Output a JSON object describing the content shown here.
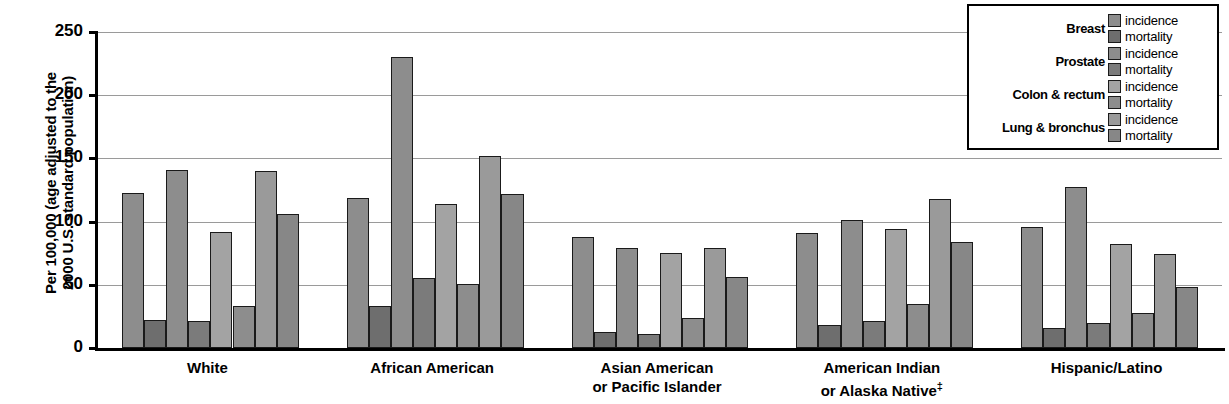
{
  "chart_data": {
    "type": "bar",
    "title": "",
    "xlabel": "",
    "ylabel": "Per 100,000 (age adjusted to the 2000 U.S. standard population)",
    "ylim": [
      0,
      250
    ],
    "yticks": [
      0,
      50,
      100,
      150,
      200,
      250
    ],
    "grid": true,
    "legend_position": "top-right",
    "categories": [
      "White",
      "African American",
      "Asian American or Pacific Islander",
      "American Indian or Alaska Native‡",
      "Hispanic/Latino"
    ],
    "series": [
      {
        "name": "Breast incidence",
        "key": "inc-breast",
        "color": "#8d8d8d",
        "values": [
          123,
          119,
          88,
          91,
          96
        ]
      },
      {
        "name": "Breast mortality",
        "key": "mor-breast",
        "color": "#6e6e6e",
        "values": [
          22,
          33,
          13,
          18,
          16
        ]
      },
      {
        "name": "Prostate incidence",
        "key": "inc-prostate",
        "color": "#8d8d8d",
        "values": [
          141,
          230,
          79,
          101,
          127
        ]
      },
      {
        "name": "Prostate mortality",
        "key": "mor-prostate",
        "color": "#7b7b7b",
        "values": [
          21,
          55,
          11,
          21,
          20
        ]
      },
      {
        "name": "Colon & rectum incidence",
        "key": "inc-colon",
        "color": "#a3a3a3",
        "values": [
          92,
          114,
          75,
          94,
          82
        ]
      },
      {
        "name": "Colon & rectum mortality",
        "key": "mor-colon",
        "color": "#8d8d8d",
        "values": [
          33,
          51,
          24,
          35,
          28
        ]
      },
      {
        "name": "Lung & bronchus incidence",
        "key": "inc-lung",
        "color": "#9a9a9a",
        "values": [
          140,
          152,
          79,
          118,
          74
        ]
      },
      {
        "name": "Lung & bronchus mortality",
        "key": "mor-lung",
        "color": "#878787",
        "values": [
          106,
          122,
          56,
          84,
          48
        ]
      }
    ]
  },
  "axis": {
    "y_title_line1": "Per 100,000 (age adjusted to the",
    "y_title_line2": "2000 U.S. standard population)",
    "ticks": [
      "250",
      "200",
      "150",
      "100",
      "50",
      "0"
    ]
  },
  "groups": [
    {
      "label_line1": "White",
      "label_line2": ""
    },
    {
      "label_line1": "African American",
      "label_line2": ""
    },
    {
      "label_line1": "Asian American",
      "label_line2": "or Pacific Islander"
    },
    {
      "label_line1": "American Indian",
      "label_line2": "or Alaska Native",
      "dagger": "‡"
    },
    {
      "label_line1": "Hispanic/Latino",
      "label_line2": ""
    }
  ],
  "legend": {
    "rows": [
      {
        "name": "Breast",
        "incidence": "incidence",
        "mortality": "mortality",
        "inc_color": "#8d8d8d",
        "mor_color": "#6e6e6e"
      },
      {
        "name": "Prostate",
        "incidence": "incidence",
        "mortality": "mortality",
        "inc_color": "#8d8d8d",
        "mor_color": "#7b7b7b"
      },
      {
        "name": "Colon & rectum",
        "incidence": "incidence",
        "mortality": "mortality",
        "inc_color": "#a3a3a3",
        "mor_color": "#8d8d8d"
      },
      {
        "name": "Lung & bronchus",
        "incidence": "incidence",
        "mortality": "mortality",
        "inc_color": "#9a9a9a",
        "mor_color": "#878787"
      }
    ]
  }
}
